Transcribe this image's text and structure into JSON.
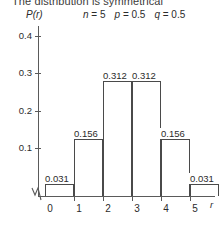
{
  "heading": {
    "text": "The distribution is symmetrical"
  },
  "params": {
    "n_label": "n",
    "n_value": "= 5",
    "p_label": "p",
    "p_value": "= 0.5",
    "q_label": "q",
    "q_value": "= 0.5"
  },
  "axes": {
    "ylabel": "P(r)",
    "xlabel": "r",
    "ytick_labels": [
      "0.4",
      "0.3",
      "0.2",
      "0.1"
    ],
    "xtick_labels": [
      "0",
      "1",
      "2",
      "3",
      "4",
      "5"
    ]
  },
  "chart_data": {
    "type": "bar",
    "title": "The distribution is symmetrical",
    "subtitle": "n = 5   p = 0.5   q = 0.5",
    "categories": [
      "0",
      "1",
      "2",
      "3",
      "4",
      "5"
    ],
    "values": [
      0.031,
      0.156,
      0.312,
      0.312,
      0.156,
      0.031
    ],
    "data_labels": [
      "0.031",
      "0.156",
      "0.312",
      "0.312",
      "0.156",
      "0.031"
    ],
    "xlabel": "r",
    "ylabel": "P(r)",
    "xlim": [
      -0.5,
      5.5
    ],
    "ylim": [
      0,
      0.45
    ],
    "ytick_values": [
      0.1,
      0.2,
      0.3,
      0.4
    ],
    "grid": false,
    "legend": null,
    "bar_style": "outline",
    "axis_break_at_origin": true
  },
  "bars": [
    {
      "label": "0.031",
      "left": 45,
      "width": 29,
      "top": 184,
      "height": 12
    },
    {
      "label": "0.156",
      "left": 74,
      "width": 29,
      "top": 139,
      "height": 57
    },
    {
      "label": "0.312",
      "left": 103,
      "width": 29,
      "top": 81,
      "height": 115
    },
    {
      "label": "0.312",
      "left": 132,
      "width": 29,
      "top": 81,
      "height": 115
    },
    {
      "label": "0.156",
      "left": 161,
      "width": 29,
      "top": 139,
      "height": 57
    },
    {
      "label": "0.031",
      "left": 190,
      "width": 29,
      "top": 184,
      "height": 12
    }
  ],
  "bar_labels": [
    {
      "text": "0.031",
      "left": 44,
      "top": 173
    },
    {
      "text": "0.156",
      "left": 73,
      "top": 128
    },
    {
      "text": "0.312",
      "left": 102,
      "top": 70
    },
    {
      "text": "0.312",
      "left": 131,
      "top": 70
    },
    {
      "text": "0.156",
      "left": 160,
      "top": 128
    },
    {
      "text": "0.031",
      "left": 189,
      "top": 173
    }
  ],
  "ytick_positions": [
    36,
    73,
    111,
    148
  ],
  "xtick_positions": [
    74,
    103,
    132,
    161,
    190
  ],
  "xtick_label_positions": [
    50,
    79,
    108,
    137,
    166,
    195
  ]
}
